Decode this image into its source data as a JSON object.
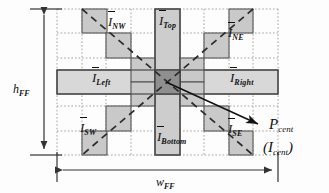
{
  "figure": {
    "type": "technical-diagram",
    "background": "#fdfdfd",
    "grid": {
      "line_color": "#9a9a9a",
      "style": "dotted",
      "cols": 9,
      "rows": 6,
      "x0": 57,
      "y0": 9,
      "cell_w": 24.6,
      "cell_h": 24.2
    },
    "colors": {
      "block_fill": "#c9c9c9",
      "block_stroke": "#555555",
      "bar_fill": "#d8d8d8",
      "bar_stroke": "#4a4a4a",
      "center_fill": "#8f8f8f",
      "dash_color": "#2b2b2b",
      "arrow_color": "#111111"
    }
  },
  "labels": {
    "nw": {
      "symbol": "I",
      "sub": "NW",
      "overbar": true
    },
    "ne": {
      "symbol": "I",
      "sub": "NE",
      "overbar": true
    },
    "sw": {
      "symbol": "I",
      "sub": "SW",
      "overbar": true
    },
    "se": {
      "symbol": "I",
      "sub": "SE",
      "overbar": true
    },
    "top": {
      "symbol": "I",
      "sub": "Top",
      "overbar": true
    },
    "bottom": {
      "symbol": "I",
      "sub": "Bottom",
      "overbar": true
    },
    "left": {
      "symbol": "I",
      "sub": "Left",
      "overbar": true
    },
    "right": {
      "symbol": "I",
      "sub": "Right",
      "overbar": true
    }
  },
  "dimensions": {
    "height": {
      "symbol": "h",
      "sub": "FF"
    },
    "width": {
      "symbol": "w",
      "sub": "FF"
    }
  },
  "center_point": {
    "primary": {
      "symbol": "P",
      "sub": "cent"
    },
    "secondary": {
      "open": "(",
      "symbol": "I",
      "sub": "cent",
      "close": ")"
    }
  }
}
